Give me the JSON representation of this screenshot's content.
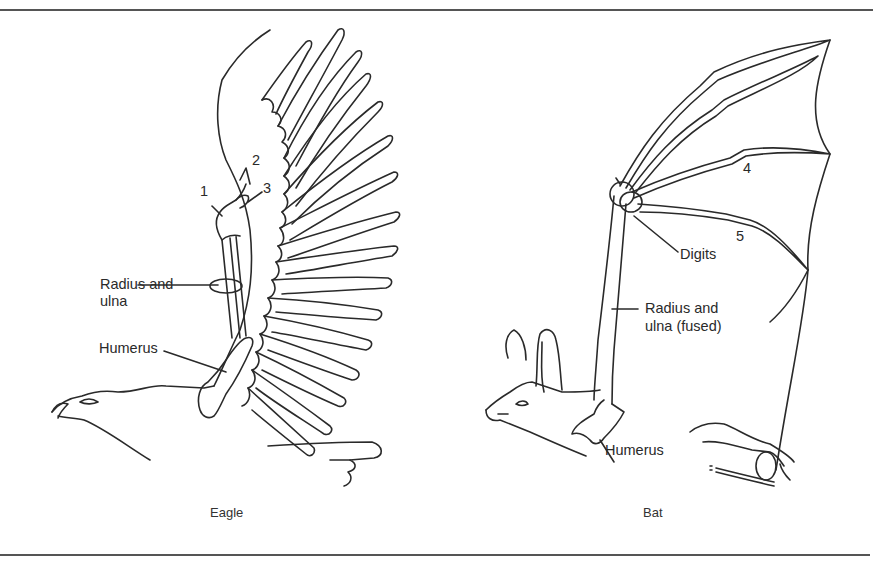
{
  "figure": {
    "panels": [
      {
        "id": "eagle",
        "caption": "Eagle",
        "labels": {
          "digit_1": "1",
          "digit_2": "2",
          "digit_3": "3",
          "radius_ulna_line1": "Radius and",
          "radius_ulna_line2": "ulna",
          "humerus": "Humerus"
        }
      },
      {
        "id": "bat",
        "caption": "Bat",
        "labels": {
          "digit_4": "4",
          "digit_5": "5",
          "digits": "Digits",
          "radius_ulna_line1": "Radius and",
          "radius_ulna_line2": "ulna (fused)",
          "humerus": "Humerus"
        }
      }
    ],
    "colors": {
      "line": "#2a2a2a",
      "rule": "#555555",
      "background": "#ffffff"
    }
  }
}
